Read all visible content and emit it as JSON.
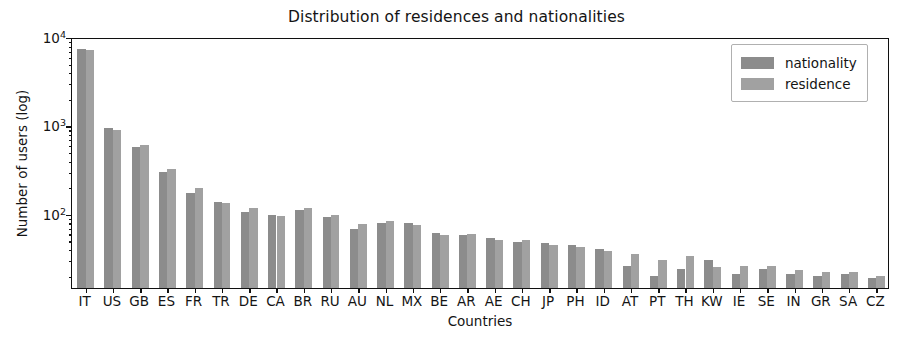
{
  "chart_data": {
    "type": "bar",
    "title": "Distribution of residences and nationalities",
    "xlabel": "Countries",
    "ylabel": "Number of users (log)",
    "yscale": "log",
    "ylim": [
      14.5,
      10000
    ],
    "grid": false,
    "legend_position": "upper right",
    "categories": [
      "IT",
      "US",
      "GB",
      "ES",
      "FR",
      "TR",
      "DE",
      "CA",
      "BR",
      "RU",
      "AU",
      "NL",
      "MX",
      "BE",
      "AR",
      "AE",
      "CH",
      "JP",
      "PH",
      "ID",
      "AT",
      "PT",
      "TH",
      "KW",
      "IE",
      "SE",
      "IN",
      "GR",
      "SA",
      "CZ"
    ],
    "series": [
      {
        "name": "nationality",
        "color": "#8c8c8c",
        "values": [
          7400,
          940,
          570,
          300,
          170,
          135,
          105,
          97,
          110,
          92,
          67,
          78,
          78,
          60,
          57,
          53,
          48,
          47,
          44,
          40,
          26,
          20,
          24,
          30,
          21,
          24,
          21,
          20,
          21,
          19
        ]
      },
      {
        "name": "residence",
        "color": "#a1a1a1",
        "values": [
          7150,
          880,
          600,
          320,
          195,
          133,
          115,
          95,
          118,
          97,
          77,
          83,
          75,
          57,
          59,
          50,
          50,
          45,
          42,
          38,
          35,
          30,
          33,
          25,
          26,
          26,
          23,
          22,
          22,
          20
        ]
      }
    ],
    "ytick_labels": [
      {
        "label_base": "10",
        "label_exp": "2",
        "value": 100
      },
      {
        "label_base": "10",
        "label_exp": "3",
        "value": 1000
      },
      {
        "label_base": "10",
        "label_exp": "4",
        "value": 10000
      }
    ]
  },
  "legend": {
    "items": [
      {
        "label": "nationality"
      },
      {
        "label": "residence"
      }
    ]
  }
}
